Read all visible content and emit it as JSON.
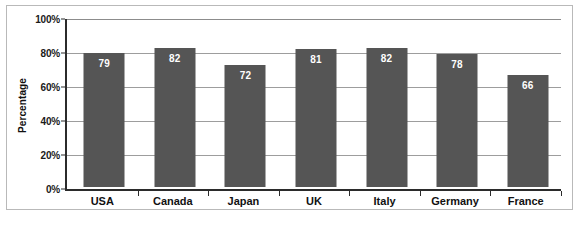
{
  "chart_data": {
    "type": "bar",
    "title": "",
    "subtitle": "",
    "xlabel": "",
    "ylabel": "Percentage",
    "categories": [
      "USA",
      "Canada",
      "Japan",
      "UK",
      "Italy",
      "Germany",
      "France"
    ],
    "values": [
      79,
      82,
      72,
      81,
      82,
      78,
      66
    ],
    "value_labels": [
      "79",
      "82",
      "72",
      "81",
      "82",
      "78",
      "66"
    ],
    "series": [
      {
        "name": "Percentage",
        "values": [
          79,
          82,
          72,
          81,
          82,
          78,
          66
        ]
      }
    ],
    "ylim": [
      0,
      100
    ],
    "y_ticks": [
      0,
      20,
      40,
      60,
      80,
      100
    ],
    "y_tick_labels": [
      "0%",
      "20%",
      "40%",
      "60%",
      "80%",
      "100%"
    ],
    "grid": true,
    "grid_axis": "y",
    "legend": false,
    "legend_position": "none",
    "bar_color": "#555555",
    "value_label_color": "#ffffff",
    "gridline_color": "#9d9d9d",
    "axis_color": "#2b2b2b",
    "plot_background": "#ffffff",
    "frame_border_color": "#b9b9b9",
    "annotations": []
  }
}
